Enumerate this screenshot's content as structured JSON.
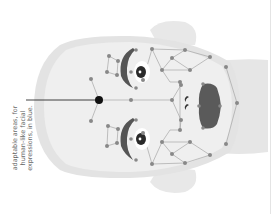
{
  "diagram": {
    "orientation": "rotated counter-clockwise; forehead at left, chin at right",
    "caption": {
      "lines": [
        "adaptable areas, for",
        "human-like facial",
        "expressions, in blue."
      ]
    },
    "colors": {
      "background": "#ffffff",
      "head_outer": "#e3e3e3",
      "head_inner": "#efefef",
      "neck": "#e6e6e6",
      "ear": "#e8e8e8",
      "node": "#888888",
      "edge": "#9a9a9a",
      "feature_dark": "#555555",
      "eye_dark": "#2a2a2a",
      "pointer": "#111111",
      "caption_text": "#666666"
    },
    "pointer": {
      "from": [
        26,
        100
      ],
      "to": [
        99,
        100
      ],
      "dot_radius": 4
    },
    "nodes_count_approx": 50,
    "regions": [
      "left-brow",
      "right-brow",
      "left-eye",
      "right-eye",
      "forehead",
      "nose",
      "mouth",
      "left-cheek",
      "right-cheek",
      "chin"
    ]
  }
}
